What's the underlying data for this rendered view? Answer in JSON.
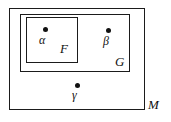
{
  "diagram": {
    "type": "nested-set-diagram",
    "stroke_color": "#1b1b1b",
    "background_color": "#ffffff",
    "point_color": "#111111",
    "sets": [
      {
        "id": "m",
        "label": "M",
        "label_position": "outside-bottom-right",
        "x": 9,
        "y": 8,
        "width": 136,
        "height": 102
      },
      {
        "id": "g",
        "label": "G",
        "label_position": "inside-bottom-right",
        "x": 20,
        "y": 14,
        "width": 110,
        "height": 58
      },
      {
        "id": "f",
        "label": "F",
        "label_position": "inside-bottom-right",
        "x": 26,
        "y": 17,
        "width": 52,
        "height": 46
      }
    ],
    "points": [
      {
        "id": "alpha",
        "label": "α",
        "x": 45,
        "y": 29,
        "member_of": "F"
      },
      {
        "id": "beta",
        "label": "β",
        "x": 108,
        "y": 30,
        "member_of": "G"
      },
      {
        "id": "gamma",
        "label": "γ",
        "x": 77,
        "y": 85,
        "member_of": "M"
      }
    ]
  }
}
